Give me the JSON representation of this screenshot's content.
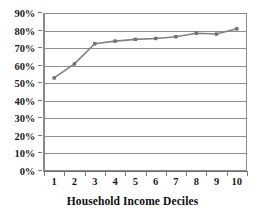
{
  "chart_data": {
    "type": "line",
    "title": "",
    "subtitle": "",
    "xlabel": "Household Income Deciles",
    "ylabel": "",
    "categories": [
      "1",
      "2",
      "3",
      "4",
      "5",
      "6",
      "7",
      "8",
      "9",
      "10"
    ],
    "x": [
      1,
      2,
      3,
      4,
      5,
      6,
      7,
      8,
      9,
      10
    ],
    "values": [
      53,
      61,
      72.5,
      74,
      75,
      75.5,
      76.5,
      78.5,
      78,
      81
    ],
    "value_unit": "%",
    "ylim": [
      0,
      90
    ],
    "ytick_labels": [
      "0%",
      "10%",
      "20%",
      "30%",
      "40%",
      "50%",
      "60%",
      "70%",
      "80%",
      "90%"
    ],
    "ytick_values": [
      0,
      10,
      20,
      30,
      40,
      50,
      60,
      70,
      80,
      90
    ],
    "xtick_labels": [
      "1",
      "2",
      "3",
      "4",
      "5",
      "6",
      "7",
      "8",
      "9",
      "10"
    ],
    "grid": "horizontal",
    "legend": "none",
    "series": [
      {
        "name": "",
        "values": [
          53,
          61,
          72.5,
          74,
          75,
          75.5,
          76.5,
          78.5,
          78,
          81
        ],
        "color": "#808080",
        "marker": "square",
        "marker_color": "#707070"
      }
    ],
    "annotations": []
  },
  "style": {
    "line_color": "#808080",
    "marker_color": "#6e6e6e",
    "grid_color": "#8f8f8f",
    "axis_color": "#7a7a7a",
    "text_color": "#1b1b1b",
    "background": "#ffffff"
  },
  "geometry": {
    "plot_left": 44,
    "plot_top": 13,
    "plot_width": 203,
    "plot_height": 158
  }
}
